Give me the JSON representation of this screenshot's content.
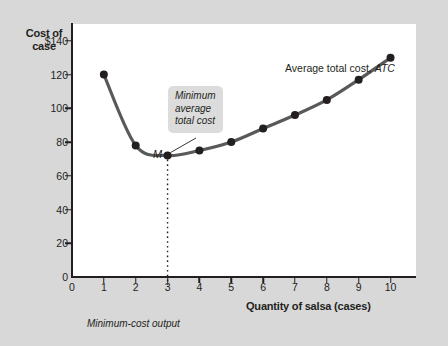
{
  "chart_data": {
    "type": "line",
    "title": "",
    "xlabel": "Quantity of salsa (cases)",
    "ylabel": "Cost of case",
    "xlim": [
      0,
      10.8
    ],
    "ylim": [
      0,
      150
    ],
    "grid": false,
    "legend_position": "inside-top-right",
    "series": [
      {
        "name": "Average total cost, ATC",
        "x": [
          1,
          2,
          3,
          4,
          5,
          6,
          7,
          8,
          9,
          10
        ],
        "values": [
          120,
          78,
          72,
          75,
          80,
          88,
          96,
          105,
          117,
          130
        ]
      }
    ],
    "x_ticks": [
      "0",
      "1",
      "2",
      "3",
      "4",
      "5",
      "6",
      "7",
      "8",
      "9",
      "10"
    ],
    "y_ticks": [
      "0",
      "20",
      "40",
      "60",
      "80",
      "100",
      "120",
      "$140"
    ],
    "y_tick_values": [
      0,
      20,
      40,
      60,
      80,
      100,
      120,
      140
    ],
    "annotations": [
      {
        "name": "minimum-point-label",
        "text": "M",
        "x": 3,
        "y": 72
      },
      {
        "name": "callout",
        "text_lines": [
          "Minimum",
          "average",
          "total cost"
        ],
        "points_to_x": 3,
        "points_to_y": 72
      },
      {
        "name": "minimum-cost-output-note",
        "text": "Minimum-cost output",
        "at_x": 3
      }
    ]
  },
  "axes": {
    "y_title_line1": "Cost of",
    "y_title_line2": "case",
    "x_title": "Quantity of salsa (cases)"
  },
  "legend": {
    "prefix": "Average total cost,",
    "symbol": "ATC"
  },
  "callout": {
    "line1": "Minimum",
    "line2": "average",
    "line3": "total cost"
  },
  "labels": {
    "minimum_marker": "M",
    "bottom_note": "Minimum-cost output"
  },
  "colors": {
    "background": "#d8d8d8",
    "plot_background": "#ffffff",
    "axis": "#231f20",
    "curve": "#58595b",
    "marker": "#231f20",
    "callout_background": "#dcdcdc"
  }
}
